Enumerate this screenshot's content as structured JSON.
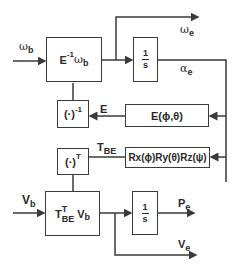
{
  "diagram": {
    "type": "block-diagram",
    "inputs": {
      "omega_b": {
        "symbol": "ω",
        "subscript": "b"
      },
      "v_b": {
        "symbol": "V",
        "subscript": "b"
      }
    },
    "outputs": {
      "omega_e": {
        "symbol": "ω",
        "subscript": "e"
      },
      "alpha_e": {
        "symbol": "α",
        "subscript": "e"
      },
      "p_e": {
        "symbol": "P",
        "subscript": "e"
      },
      "v_e": {
        "symbol": "V",
        "subscript": "e"
      }
    },
    "blocks": {
      "e_inv_omega": {
        "prefix": "E",
        "sup": "-1",
        "symbol": "ω",
        "subscript": "b"
      },
      "integrator_top": {
        "num": "1",
        "den": "s"
      },
      "inverse": {
        "text": "(·)",
        "sup": "-1"
      },
      "e_matrix": {
        "text": "E(ϕ,θ)"
      },
      "transpose": {
        "text": "(·)",
        "sup": "T"
      },
      "rotation": {
        "text": "Rx(ϕ)Ry(θ)Rz(ψ)"
      },
      "tbe_vb": {
        "prefix": "T",
        "sup": "T",
        "sub": "BE",
        "symbol": "V",
        "subscript": "b"
      },
      "integrator_bottom": {
        "num": "1",
        "den": "s"
      }
    },
    "signals": {
      "e": {
        "text": "E"
      },
      "t_be": {
        "symbol": "T",
        "subscript": "BE"
      }
    },
    "colors": {
      "line": "#3a3a3a",
      "text": "#2a2a2a",
      "background": "#ffffff"
    }
  }
}
